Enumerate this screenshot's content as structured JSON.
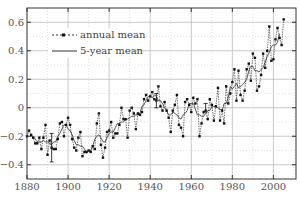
{
  "chart_data": {
    "type": "line",
    "title": "",
    "xlabel": "",
    "ylabel": "",
    "xlim": [
      1880,
      2011
    ],
    "ylim": [
      -0.5,
      0.7
    ],
    "x_ticks": [
      1880,
      1900,
      1920,
      1940,
      1960,
      1980,
      2000
    ],
    "y_ticks": [
      -0.4,
      -0.2,
      0,
      0.2,
      0.4,
      0.6
    ],
    "y_tick_labels": [
      "−0.4",
      "−0.2",
      "0",
      "0.2",
      "0.4",
      "0.6"
    ],
    "grid": true,
    "legend_position": "upper-left",
    "legend": [
      "annual mean",
      "5-year mean"
    ],
    "x": [
      1880,
      1881,
      1882,
      1883,
      1884,
      1885,
      1886,
      1887,
      1888,
      1889,
      1890,
      1891,
      1892,
      1893,
      1894,
      1895,
      1896,
      1897,
      1898,
      1899,
      1900,
      1901,
      1902,
      1903,
      1904,
      1905,
      1906,
      1907,
      1908,
      1909,
      1910,
      1911,
      1912,
      1913,
      1914,
      1915,
      1916,
      1917,
      1918,
      1919,
      1920,
      1921,
      1922,
      1923,
      1924,
      1925,
      1926,
      1927,
      1928,
      1929,
      1930,
      1931,
      1932,
      1933,
      1934,
      1935,
      1936,
      1937,
      1938,
      1939,
      1940,
      1941,
      1942,
      1943,
      1944,
      1945,
      1946,
      1947,
      1948,
      1949,
      1950,
      1951,
      1952,
      1953,
      1954,
      1955,
      1956,
      1957,
      1958,
      1959,
      1960,
      1961,
      1962,
      1963,
      1964,
      1965,
      1966,
      1967,
      1968,
      1969,
      1970,
      1971,
      1972,
      1973,
      1974,
      1975,
      1976,
      1977,
      1978,
      1979,
      1980,
      1981,
      1982,
      1983,
      1984,
      1985,
      1986,
      1987,
      1988,
      1989,
      1990,
      1991,
      1992,
      1993,
      1994,
      1995,
      1996,
      1997,
      1998,
      1999,
      2000,
      2001,
      2002,
      2003,
      2004,
      2005
    ],
    "series": [
      {
        "name": "annual mean",
        "style": "dashed-with-markers",
        "values": [
          -0.2,
          -0.16,
          -0.19,
          -0.21,
          -0.25,
          -0.25,
          -0.21,
          -0.29,
          -0.21,
          -0.12,
          -0.33,
          -0.23,
          -0.28,
          -0.29,
          -0.29,
          -0.22,
          -0.11,
          -0.1,
          -0.2,
          -0.12,
          -0.07,
          -0.12,
          -0.22,
          -0.28,
          -0.3,
          -0.21,
          -0.17,
          -0.34,
          -0.31,
          -0.31,
          -0.3,
          -0.31,
          -0.27,
          -0.29,
          -0.11,
          -0.04,
          -0.26,
          -0.35,
          -0.28,
          -0.17,
          -0.16,
          -0.1,
          -0.21,
          -0.18,
          -0.18,
          -0.12,
          0.0,
          -0.08,
          -0.08,
          -0.21,
          -0.02,
          0.0,
          -0.04,
          -0.15,
          -0.04,
          -0.05,
          -0.03,
          0.06,
          0.09,
          0.05,
          0.08,
          0.11,
          0.06,
          0.05,
          0.15,
          0.01,
          -0.02,
          0.04,
          -0.02,
          -0.07,
          -0.17,
          -0.02,
          0.02,
          0.09,
          -0.12,
          -0.14,
          -0.2,
          0.04,
          0.06,
          0.02,
          -0.03,
          0.07,
          0.03,
          0.06,
          -0.2,
          -0.11,
          -0.03,
          -0.02,
          -0.08,
          0.06,
          0.02,
          -0.09,
          0.01,
          0.14,
          -0.09,
          -0.02,
          -0.11,
          0.15,
          0.03,
          0.1,
          0.18,
          0.27,
          0.05,
          0.26,
          0.09,
          0.05,
          0.12,
          0.27,
          0.31,
          0.19,
          0.38,
          0.35,
          0.12,
          0.15,
          0.23,
          0.38,
          0.28,
          0.4,
          0.57,
          0.33,
          0.34,
          0.48,
          0.56,
          0.49,
          0.44,
          0.62
        ]
      },
      {
        "name": "5-year mean",
        "style": "solid",
        "values": [
          null,
          null,
          -0.2,
          -0.2,
          -0.22,
          -0.24,
          -0.24,
          -0.24,
          -0.23,
          -0.24,
          -0.24,
          -0.25,
          -0.26,
          -0.24,
          -0.24,
          -0.2,
          -0.18,
          -0.15,
          -0.12,
          -0.12,
          -0.15,
          -0.16,
          -0.19,
          -0.23,
          -0.26,
          -0.26,
          -0.27,
          -0.27,
          -0.29,
          -0.32,
          -0.3,
          -0.3,
          -0.27,
          -0.22,
          -0.2,
          -0.19,
          -0.21,
          -0.24,
          -0.24,
          -0.21,
          -0.18,
          -0.17,
          -0.17,
          -0.14,
          -0.11,
          -0.11,
          -0.1,
          -0.1,
          -0.08,
          -0.08,
          -0.07,
          -0.06,
          -0.06,
          -0.05,
          -0.05,
          -0.04,
          0.01,
          0.02,
          0.05,
          0.08,
          0.08,
          0.07,
          0.09,
          0.08,
          0.05,
          0.05,
          0.03,
          0.0,
          -0.02,
          -0.05,
          -0.05,
          -0.03,
          -0.04,
          -0.05,
          -0.07,
          -0.08,
          -0.05,
          -0.04,
          -0.02,
          0.03,
          0.03,
          0.03,
          -0.01,
          -0.05,
          -0.05,
          -0.06,
          -0.06,
          -0.04,
          -0.02,
          -0.02,
          0.01,
          0.01,
          0.01,
          0.0,
          -0.01,
          -0.02,
          0.03,
          0.03,
          0.07,
          0.15,
          0.13,
          0.15,
          0.17,
          0.14,
          0.15,
          0.16,
          0.18,
          0.2,
          0.26,
          0.29,
          0.29,
          0.26,
          0.26,
          0.25,
          0.27,
          0.28,
          0.32,
          0.36,
          0.39,
          0.43,
          0.44,
          0.44,
          0.46,
          0.52,
          null,
          null
        ]
      }
    ],
    "error_bars": [
      {
        "x": 1892,
        "y": -0.28,
        "low": -0.38,
        "high": -0.18
      },
      {
        "x": 1943,
        "y": 0.05,
        "low": 0.0,
        "high": 0.1
      },
      {
        "x": 1967,
        "y": 0.0,
        "low": -0.03,
        "high": 0.03
      }
    ]
  },
  "caption": {
    "text": "ollie.... ood a.t.i.... . a.l.l...... .li.l.l... .... .a.l.l..a.l.C..... ."
  }
}
